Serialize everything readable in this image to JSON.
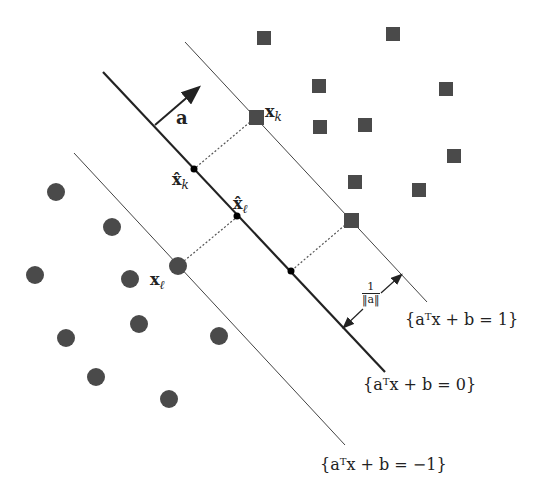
{
  "diagram": {
    "colors": {
      "points": "#4a4a4a",
      "lines": "#222222",
      "background": "#ffffff"
    },
    "lines": [
      {
        "name": "hyperplane-zero",
        "x1": 103,
        "y1": 72,
        "x2": 385,
        "y2": 372,
        "width": 2.2
      },
      {
        "name": "hyperplane-plus-one",
        "x1": 185,
        "y1": 42,
        "x2": 427,
        "y2": 302,
        "width": 1
      },
      {
        "name": "hyperplane-minus-one",
        "x1": 74,
        "y1": 153,
        "x2": 345,
        "y2": 445,
        "width": 1
      }
    ],
    "squares": [
      [
        264,
        38
      ],
      [
        393,
        34
      ],
      [
        319,
        86
      ],
      [
        446,
        89
      ],
      [
        320,
        127
      ],
      [
        365,
        125
      ],
      [
        454,
        156
      ],
      [
        355,
        182
      ],
      [
        419,
        190
      ],
      [
        256,
        117
      ],
      [
        351,
        220
      ]
    ],
    "circles": [
      [
        56,
        192
      ],
      [
        112,
        227
      ],
      [
        35,
        275
      ],
      [
        130,
        279
      ],
      [
        178,
        266
      ],
      [
        139,
        324
      ],
      [
        66,
        338
      ],
      [
        219,
        336
      ],
      [
        96,
        377
      ],
      [
        169,
        399
      ]
    ],
    "labels": {
      "a": "a",
      "xk": "x",
      "xk_sub": "k",
      "xhat_k": "x̂",
      "xhat_k_sub": "k",
      "xhat_l": "x̂",
      "xhat_l_sub": "ℓ",
      "xl": "x",
      "xl_sub": "ℓ",
      "frac_num": "1",
      "frac_den": "‖a‖",
      "eq_plus_one": "{aᵀx + b = 1}",
      "eq_zero": "{aᵀx + b = 0}",
      "eq_minus_one": "{aᵀx + b = −1}"
    }
  }
}
